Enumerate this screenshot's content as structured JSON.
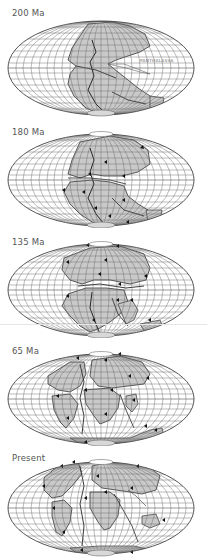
{
  "figure": {
    "projection": "equal-area ellipse (Mollweide-style)",
    "colors": {
      "background": "#ffffff",
      "ocean": "#ffffff",
      "continent_fill": "#c9c9c9",
      "grid_line": "#6a6a6a",
      "coastline": "#333333",
      "plate_boundary": "#222222",
      "motion_arrow": "#111111",
      "label_text": "#555555"
    }
  },
  "panels": [
    {
      "label": "200 Ma",
      "annotations": [
        {
          "text": "PANTHALASSA",
          "type": "ocean-name"
        }
      ]
    },
    {
      "label": "180 Ma",
      "annotations": []
    },
    {
      "label": "135 Ma",
      "annotations": []
    },
    {
      "label": "65 Ma",
      "annotations": []
    },
    {
      "label": "Present",
      "annotations": []
    }
  ]
}
